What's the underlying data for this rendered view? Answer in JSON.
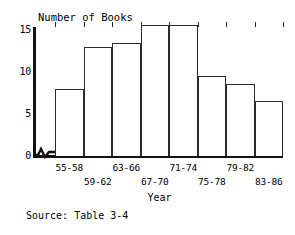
{
  "chart_data": {
    "type": "bar",
    "title": "",
    "ylabel": "Number of Books",
    "xlabel": "Year",
    "categories": [
      "55-58",
      "59-62",
      "63-66",
      "67-70",
      "71-74",
      "75-78",
      "79-82",
      "83-86"
    ],
    "values": [
      8,
      13,
      13.5,
      15.7,
      15.7,
      9.5,
      8.6,
      6.6
    ],
    "yticks": [
      "0",
      "5",
      "10",
      "15"
    ],
    "ytick_values": [
      0,
      5,
      10,
      15
    ],
    "ylim": [
      0,
      16
    ],
    "grid": false,
    "legend": null,
    "axis_break": "zigzag-on-x-axis-near-origin",
    "bar_fill": "#ffffff",
    "bar_stroke": "#2b2b2b",
    "axis_color": "#111111"
  },
  "annotations": {
    "source_note": "Source: Table 3-4"
  }
}
